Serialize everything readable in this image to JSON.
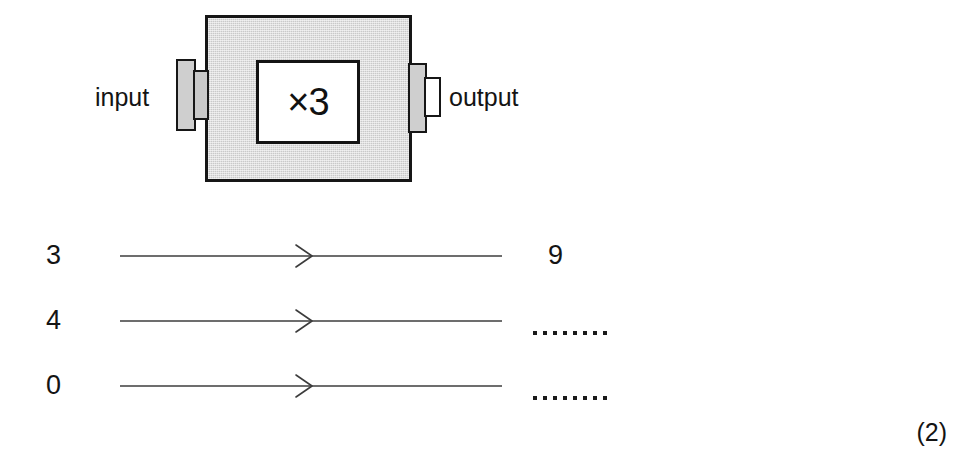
{
  "machine": {
    "operation_label": "×3",
    "input_label": "input",
    "output_label": "output",
    "body_fill_color": "#c9c9c9",
    "outline_color": "#161616"
  },
  "mapping": {
    "rows": [
      {
        "input": "3",
        "output": "9",
        "blank": false,
        "arrow": "rightwards-arrow"
      },
      {
        "input": "4",
        "output": "",
        "blank": true,
        "arrow": "rightwards-arrow"
      },
      {
        "input": "0",
        "output": "",
        "blank": true,
        "arrow": "rightwards-arrow"
      }
    ],
    "blank_dot_count": 8
  },
  "marks": {
    "value": "(2)"
  }
}
